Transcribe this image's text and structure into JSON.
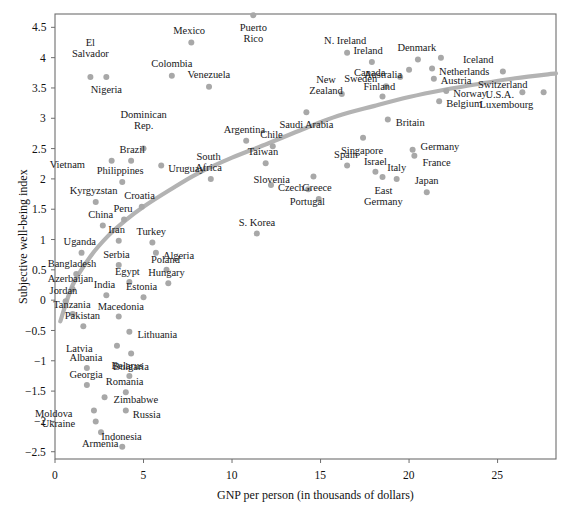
{
  "chart_data": {
    "type": "scatter",
    "title": "",
    "xlabel": "GNP per person (in thousands of dollars)",
    "ylabel": "Subjective well-being index",
    "xlim": [
      0,
      28.3
    ],
    "ylim": [
      -2.62,
      4.72
    ],
    "xticks": [
      0,
      5,
      10,
      15,
      20,
      25
    ],
    "xticklabels": [
      "0",
      "5",
      "10",
      "15",
      "20",
      "25"
    ],
    "yticks": [
      -2.5,
      -2,
      -1.5,
      -1,
      -0.5,
      0,
      0.5,
      1,
      1.5,
      2,
      2.5,
      3,
      3.5,
      4,
      4.5
    ],
    "yticklabels": [
      "−2.5",
      "−2",
      "−1.5",
      "−1",
      "−0.5",
      "0",
      "0.5",
      "1",
      "1.5",
      "2",
      "2.5",
      "3",
      "3.5",
      "4",
      "4.5"
    ],
    "grid": false,
    "legend": null,
    "point_color": "#a8a8a8",
    "trend_color": "#b3b3b3",
    "frame_color": "#6e6e6e",
    "points": [
      {
        "name": "Puerto Rico",
        "x": 11.2,
        "y": 4.7,
        "lx": 0,
        "ly": 10,
        "align": "center",
        "lines": [
          "Puerto",
          "Rico"
        ]
      },
      {
        "name": "Mexico",
        "x": 7.7,
        "y": 4.25,
        "lx": -2,
        "ly": -12,
        "align": "center",
        "lines": [
          "Mexico"
        ]
      },
      {
        "name": "El Salvador",
        "x": 2.0,
        "y": 3.68,
        "lx": 0,
        "ly": -24,
        "align": "center",
        "lines": [
          "El",
          "Salvador"
        ]
      },
      {
        "name": "Colombia",
        "x": 6.6,
        "y": 3.7,
        "lx": 0,
        "ly": -12,
        "align": "center",
        "lines": [
          "Colombia"
        ]
      },
      {
        "name": "Nigeria",
        "x": 2.9,
        "y": 3.68,
        "lx": 0,
        "ly": 11,
        "align": "center",
        "lines": [
          "Nigeria"
        ]
      },
      {
        "name": "Venezuela",
        "x": 8.7,
        "y": 3.52,
        "lx": 0,
        "ly": -12,
        "align": "center",
        "lines": [
          "Venezuela"
        ]
      },
      {
        "name": "N. Ireland",
        "x": 16.5,
        "y": 4.08,
        "lx": -2,
        "ly": -12,
        "align": "center",
        "lines": [
          "N. Ireland"
        ]
      },
      {
        "name": "Ireland",
        "x": 17.9,
        "y": 3.93,
        "lx": -4,
        "ly": -11,
        "align": "center",
        "lines": [
          "Ireland"
        ]
      },
      {
        "name": "Denmark",
        "x": 20.5,
        "y": 3.97,
        "lx": -1,
        "ly": -12,
        "align": "center",
        "lines": [
          "Denmark"
        ]
      },
      {
        "name": "Iceland",
        "x": 21.8,
        "y": 4.0,
        "lx": 22,
        "ly": 0,
        "align": "left",
        "lines": [
          "Iceland"
        ]
      },
      {
        "name": "Canada",
        "x": 20.0,
        "y": 3.8,
        "lx": -24,
        "ly": 1,
        "align": "right",
        "lines": [
          "Canada"
        ]
      },
      {
        "name": "Netherlands",
        "x": 21.3,
        "y": 3.82,
        "lx": 7,
        "ly": 1,
        "align": "left",
        "lines": [
          "Netherlands"
        ]
      },
      {
        "name": "Sweden",
        "x": 19.5,
        "y": 3.68,
        "lx": -23,
        "ly": 0,
        "align": "right",
        "lines": [
          "Sweden"
        ]
      },
      {
        "name": "Austria",
        "x": 21.4,
        "y": 3.65,
        "lx": 7,
        "ly": 0,
        "align": "left",
        "lines": [
          "Austria"
        ]
      },
      {
        "name": "Switzerland",
        "x": 25.3,
        "y": 3.77,
        "lx": 0,
        "ly": 11,
        "align": "center",
        "lines": [
          "Switzerland"
        ]
      },
      {
        "name": "Australia",
        "x": 18.7,
        "y": 3.53,
        "lx": -3,
        "ly": -11,
        "align": "center",
        "lines": [
          "Australia"
        ]
      },
      {
        "name": "Finland",
        "x": 18.5,
        "y": 3.36,
        "lx": -3,
        "ly": -10,
        "align": "center",
        "lines": [
          "Finland"
        ]
      },
      {
        "name": "New Zealand",
        "x": 16.2,
        "y": 3.4,
        "lx": -16,
        "ly": -4,
        "align": "center",
        "lines": [
          "New",
          "Zealand"
        ]
      },
      {
        "name": "Norway",
        "x": 22.1,
        "y": 3.45,
        "lx": 7,
        "ly": 1,
        "align": "left",
        "lines": [
          "Norway"
        ]
      },
      {
        "name": "Belgium",
        "x": 21.7,
        "y": 3.28,
        "lx": 7,
        "ly": 1,
        "align": "left",
        "lines": [
          "Belgium"
        ]
      },
      {
        "name": "U.S.A.",
        "x": 26.4,
        "y": 3.43,
        "lx": -8,
        "ly": 1,
        "align": "right",
        "lines": [
          "U.S.A."
        ]
      },
      {
        "name": "Luxembourg",
        "x": 27.6,
        "y": 3.43,
        "lx": -10,
        "ly": 11,
        "align": "right",
        "lines": [
          "Luxembourg"
        ]
      },
      {
        "name": "Saudi Arabia",
        "x": 14.2,
        "y": 3.1,
        "lx": 0,
        "ly": 11,
        "align": "center",
        "lines": [
          "Saudi Arabia"
        ]
      },
      {
        "name": "Britain",
        "x": 18.8,
        "y": 2.98,
        "lx": 8,
        "ly": 1,
        "align": "left",
        "lines": [
          "Britain"
        ]
      },
      {
        "name": "Argentina",
        "x": 10.8,
        "y": 2.63,
        "lx": -2,
        "ly": -11,
        "align": "center",
        "lines": [
          "Argentina"
        ]
      },
      {
        "name": "Chile",
        "x": 12.3,
        "y": 2.54,
        "lx": -1,
        "ly": -11,
        "align": "center",
        "lines": [
          "Chile"
        ]
      },
      {
        "name": "Dominican Rep.",
        "x": 5.0,
        "y": 2.5,
        "lx": 0,
        "ly": -24,
        "align": "center",
        "lines": [
          "Dominican",
          "Rep."
        ]
      },
      {
        "name": "Singapore",
        "x": 17.4,
        "y": 2.68,
        "lx": -1,
        "ly": 11,
        "align": "center",
        "lines": [
          "Singapore"
        ]
      },
      {
        "name": "Germany",
        "x": 20.2,
        "y": 2.48,
        "lx": 8,
        "ly": -3,
        "align": "left",
        "lines": [
          "Germany"
        ]
      },
      {
        "name": "France",
        "x": 20.3,
        "y": 2.38,
        "lx": 8,
        "ly": 5,
        "align": "left",
        "lines": [
          "France"
        ]
      },
      {
        "name": "Brazil",
        "x": 4.3,
        "y": 2.3,
        "lx": 1,
        "ly": -11,
        "align": "center",
        "lines": [
          "Brazil"
        ]
      },
      {
        "name": "Taiwan",
        "x": 11.9,
        "y": 2.26,
        "lx": -3,
        "ly": -11,
        "align": "center",
        "lines": [
          "Taiwan"
        ]
      },
      {
        "name": "Vietnam",
        "x": 3.2,
        "y": 2.3,
        "lx": -27,
        "ly": 2,
        "align": "right",
        "lines": [
          "Vietnam"
        ]
      },
      {
        "name": "Uruguay",
        "x": 6.0,
        "y": 2.22,
        "lx": 7,
        "ly": 1,
        "align": "left",
        "lines": [
          "Uruguay"
        ]
      },
      {
        "name": "Spain",
        "x": 16.5,
        "y": 2.22,
        "lx": -1,
        "ly": -11,
        "align": "center",
        "lines": [
          "Spain"
        ]
      },
      {
        "name": "Israel",
        "x": 18.1,
        "y": 2.12,
        "lx": 0,
        "ly": -10,
        "align": "center",
        "lines": [
          "Israel"
        ]
      },
      {
        "name": "Italy",
        "x": 19.3,
        "y": 2.0,
        "lx": 0,
        "ly": -11,
        "align": "center",
        "lines": [
          "Italy"
        ]
      },
      {
        "name": "Slovenia",
        "x": 14.6,
        "y": 2.04,
        "lx": -24,
        "ly": 1,
        "align": "right",
        "lines": [
          "Slovenia"
        ]
      },
      {
        "name": "East Germany",
        "x": 18.5,
        "y": 2.03,
        "lx": 1,
        "ly": 11,
        "align": "center",
        "lines": [
          "East",
          "Germany"
        ]
      },
      {
        "name": "Philippines",
        "x": 3.8,
        "y": 1.95,
        "lx": -2,
        "ly": -11,
        "align": "center",
        "lines": [
          "Philippines"
        ]
      },
      {
        "name": "South Africa",
        "x": 8.8,
        "y": 2.0,
        "lx": -2,
        "ly": -12,
        "align": "center",
        "lines": [
          "South",
          "Africa"
        ]
      },
      {
        "name": "Czech",
        "x": 12.2,
        "y": 1.9,
        "lx": 7,
        "ly": 1,
        "align": "left",
        "lines": [
          "Czech"
        ]
      },
      {
        "name": "Portugal",
        "x": 14.3,
        "y": 1.83,
        "lx": -1,
        "ly": 11,
        "align": "center",
        "lines": [
          "Portugal"
        ]
      },
      {
        "name": "Japan",
        "x": 21.0,
        "y": 1.78,
        "lx": 0,
        "ly": -11,
        "align": "center",
        "lines": [
          "Japan"
        ]
      },
      {
        "name": "Kyrgyzstan",
        "x": 2.3,
        "y": 1.62,
        "lx": -2,
        "ly": -11,
        "align": "center",
        "lines": [
          "Kyrgyzstan"
        ]
      },
      {
        "name": "Croatia",
        "x": 4.9,
        "y": 1.54,
        "lx": -2,
        "ly": -11,
        "align": "center",
        "lines": [
          "Croatia"
        ]
      },
      {
        "name": "Greece",
        "x": 14.9,
        "y": 1.67,
        "lx": -2,
        "ly": -11,
        "align": "center",
        "lines": [
          "Greece"
        ]
      },
      {
        "name": "Peru",
        "x": 3.9,
        "y": 1.33,
        "lx": -1,
        "ly": -11,
        "align": "center",
        "lines": [
          "Peru"
        ]
      },
      {
        "name": "China",
        "x": 2.7,
        "y": 1.23,
        "lx": -2,
        "ly": -11,
        "align": "center",
        "lines": [
          "China"
        ]
      },
      {
        "name": "S. Korea",
        "x": 11.4,
        "y": 1.1,
        "lx": 0,
        "ly": -11,
        "align": "center",
        "lines": [
          "S. Korea"
        ]
      },
      {
        "name": "Turkey",
        "x": 5.5,
        "y": 0.95,
        "lx": -1,
        "ly": -11,
        "align": "center",
        "lines": [
          "Turkey"
        ]
      },
      {
        "name": "Iran",
        "x": 3.6,
        "y": 0.98,
        "lx": -2,
        "ly": -11,
        "align": "center",
        "lines": [
          "Iran"
        ]
      },
      {
        "name": "Algeria",
        "x": 5.7,
        "y": 0.78,
        "lx": 7,
        "ly": 1,
        "align": "left",
        "lines": [
          "Algeria"
        ]
      },
      {
        "name": "Uganda",
        "x": 1.5,
        "y": 0.78,
        "lx": -2,
        "ly": -11,
        "align": "center",
        "lines": [
          "Uganda"
        ]
      },
      {
        "name": "Serbia",
        "x": 3.6,
        "y": 0.58,
        "lx": -2,
        "ly": -10,
        "align": "center",
        "lines": [
          "Serbia"
        ]
      },
      {
        "name": "Poland",
        "x": 6.3,
        "y": 0.5,
        "lx": -1,
        "ly": -10,
        "align": "center",
        "lines": [
          "Poland"
        ]
      },
      {
        "name": "Bangladesh",
        "x": 1.2,
        "y": 0.43,
        "lx": -4,
        "ly": -10,
        "align": "center",
        "lines": [
          "Bangladesh"
        ]
      },
      {
        "name": "Egypt",
        "x": 4.2,
        "y": 0.3,
        "lx": -2,
        "ly": -10,
        "align": "center",
        "lines": [
          "Egypt"
        ]
      },
      {
        "name": "Hungary",
        "x": 6.4,
        "y": 0.28,
        "lx": -2,
        "ly": -10,
        "align": "center",
        "lines": [
          "Hungary"
        ]
      },
      {
        "name": "Azerbaijan",
        "x": 1.0,
        "y": 0.18,
        "lx": -2,
        "ly": -10,
        "align": "center",
        "lines": [
          "Azerbaijan"
        ]
      },
      {
        "name": "India",
        "x": 2.9,
        "y": 0.08,
        "lx": -2,
        "ly": -10,
        "align": "center",
        "lines": [
          "India"
        ]
      },
      {
        "name": "Estonia",
        "x": 5.0,
        "y": 0.05,
        "lx": -2,
        "ly": -10,
        "align": "center",
        "lines": [
          "Estonia"
        ]
      },
      {
        "name": "Jordan",
        "x": 0.6,
        "y": -0.02,
        "lx": -2,
        "ly": -10,
        "align": "center",
        "lines": [
          "Jordan"
        ]
      },
      {
        "name": "Tanzania",
        "x": 1.0,
        "y": -0.23,
        "lx": -1,
        "ly": -9,
        "align": "center",
        "lines": [
          "Tanzania"
        ]
      },
      {
        "name": "Macedonia",
        "x": 3.6,
        "y": -0.27,
        "lx": 2,
        "ly": -10,
        "align": "center",
        "lines": [
          "Macedonia"
        ]
      },
      {
        "name": "Pakistan",
        "x": 1.6,
        "y": -0.43,
        "lx": -1,
        "ly": -10,
        "align": "center",
        "lines": [
          "Pakistan"
        ]
      },
      {
        "name": "Lithuania",
        "x": 4.2,
        "y": -0.52,
        "lx": 8,
        "ly": 1,
        "align": "left",
        "lines": [
          "Lithuania"
        ]
      },
      {
        "name": "Latvia",
        "x": 3.5,
        "y": -0.75,
        "lx": -24,
        "ly": 1,
        "align": "right",
        "lines": [
          "Latvia"
        ]
      },
      {
        "name": "Bulgaria",
        "x": 4.3,
        "y": -0.88,
        "lx": 0,
        "ly": 11,
        "align": "center",
        "lines": [
          "Bulgaria"
        ]
      },
      {
        "name": "Albania",
        "x": 1.8,
        "y": -1.12,
        "lx": -1,
        "ly": -10,
        "align": "center",
        "lines": [
          "Albania"
        ]
      },
      {
        "name": "Belarus",
        "x": 4.2,
        "y": -1.25,
        "lx": -2,
        "ly": -10,
        "align": "center",
        "lines": [
          "Belarus"
        ]
      },
      {
        "name": "Georgia",
        "x": 1.8,
        "y": -1.4,
        "lx": -1,
        "ly": -10,
        "align": "center",
        "lines": [
          "Georgia"
        ]
      },
      {
        "name": "Romania",
        "x": 4.0,
        "y": -1.52,
        "lx": -1,
        "ly": -10,
        "align": "center",
        "lines": [
          "Romania"
        ]
      },
      {
        "name": "Zimbabwe",
        "x": 2.8,
        "y": -1.6,
        "lx": 9,
        "ly": 1,
        "align": "left",
        "lines": [
          "Zimbabwe"
        ]
      },
      {
        "name": "Moldova",
        "x": 2.2,
        "y": -1.82,
        "lx": -21,
        "ly": 1,
        "align": "right",
        "lines": [
          "Moldova"
        ]
      },
      {
        "name": "Russia",
        "x": 4.0,
        "y": -1.82,
        "lx": 7,
        "ly": 2,
        "align": "left",
        "lines": [
          "Russia"
        ]
      },
      {
        "name": "Ukraine",
        "x": 2.3,
        "y": -2.0,
        "lx": -21,
        "ly": 1,
        "align": "right",
        "lines": [
          "Ukraine"
        ]
      },
      {
        "name": "Armenia",
        "x": 2.6,
        "y": -2.18,
        "lx": -1,
        "ly": 10,
        "align": "center",
        "lines": [
          "Armenia"
        ]
      },
      {
        "name": "Indonesia",
        "x": 3.8,
        "y": -2.42,
        "lx": -1,
        "ly": -10,
        "align": "center",
        "lines": [
          "Indonesia"
        ]
      }
    ],
    "trend_curve_note": "Smooth logarithmic-shaped fitted trend line rising steeply from about (0.3, -0.35) through (5, 1.5), (10, 2.35), (15, 2.95), (20, 3.35), and flattening near (28, 3.72)",
    "trend_points": [
      {
        "x": 0.3,
        "y": -0.35
      },
      {
        "x": 1.0,
        "y": 0.25
      },
      {
        "x": 2.0,
        "y": 0.72
      },
      {
        "x": 3.0,
        "y": 1.06
      },
      {
        "x": 4.0,
        "y": 1.32
      },
      {
        "x": 5.0,
        "y": 1.54
      },
      {
        "x": 6.5,
        "y": 1.82
      },
      {
        "x": 8.0,
        "y": 2.08
      },
      {
        "x": 10.0,
        "y": 2.35
      },
      {
        "x": 12.0,
        "y": 2.58
      },
      {
        "x": 14.0,
        "y": 2.82
      },
      {
        "x": 16.0,
        "y": 3.04
      },
      {
        "x": 18.0,
        "y": 3.2
      },
      {
        "x": 20.0,
        "y": 3.35
      },
      {
        "x": 22.0,
        "y": 3.47
      },
      {
        "x": 24.0,
        "y": 3.57
      },
      {
        "x": 26.0,
        "y": 3.66
      },
      {
        "x": 28.3,
        "y": 3.74
      }
    ]
  }
}
